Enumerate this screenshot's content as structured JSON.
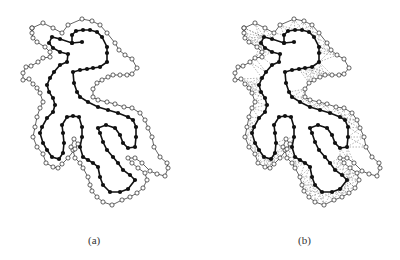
{
  "panels": [
    {
      "id": "a",
      "caption": "(a)",
      "offset_x": 0,
      "offset_y": 0,
      "spokes": false
    },
    {
      "id": "b",
      "caption": "(b)",
      "offset_x": 212,
      "offset_y": 0,
      "spokes": true
    }
  ],
  "style": {
    "inner_color": "#111111",
    "outer_color": "#222222",
    "spoke_color": "#666666",
    "background": "#ffffff"
  },
  "inner_chain": [
    [
      82,
      42
    ],
    [
      72,
      43
    ],
    [
      60,
      39
    ],
    [
      52,
      37
    ],
    [
      49,
      43
    ],
    [
      53,
      48
    ],
    [
      60,
      52
    ],
    [
      68,
      54
    ],
    [
      67,
      62
    ],
    [
      60,
      65
    ],
    [
      54,
      72
    ],
    [
      50,
      78
    ],
    [
      47,
      85
    ],
    [
      49,
      92
    ],
    [
      53,
      98
    ],
    [
      55,
      105
    ],
    [
      53,
      112
    ],
    [
      47,
      118
    ],
    [
      42,
      127
    ],
    [
      40,
      133
    ],
    [
      43,
      143
    ],
    [
      47,
      150
    ],
    [
      52,
      157
    ],
    [
      59,
      159
    ],
    [
      63,
      153
    ],
    [
      64,
      143
    ],
    [
      63,
      133
    ],
    [
      62,
      125
    ],
    [
      67,
      117
    ],
    [
      73,
      116
    ],
    [
      79,
      117
    ],
    [
      82,
      127
    ],
    [
      82,
      137
    ],
    [
      80,
      147
    ],
    [
      83,
      157
    ],
    [
      88,
      160
    ],
    [
      93,
      163
    ],
    [
      98,
      167
    ],
    [
      100,
      177
    ],
    [
      103,
      185
    ],
    [
      110,
      192
    ],
    [
      120,
      192
    ],
    [
      128,
      189
    ],
    [
      135,
      180
    ],
    [
      130,
      175
    ],
    [
      123,
      170
    ],
    [
      118,
      163
    ],
    [
      113,
      157
    ],
    [
      107,
      150
    ],
    [
      103,
      142
    ],
    [
      100,
      133
    ],
    [
      98,
      128
    ],
    [
      106,
      125
    ],
    [
      115,
      128
    ],
    [
      120,
      135
    ],
    [
      123,
      143
    ],
    [
      128,
      148
    ],
    [
      135,
      147
    ],
    [
      136,
      137
    ],
    [
      136,
      127
    ],
    [
      133,
      120
    ],
    [
      128,
      117
    ],
    [
      118,
      113
    ],
    [
      108,
      110
    ],
    [
      98,
      107
    ],
    [
      88,
      102
    ],
    [
      80,
      97
    ],
    [
      77,
      92
    ],
    [
      74,
      83
    ],
    [
      73,
      72
    ],
    [
      80,
      70
    ],
    [
      87,
      69
    ],
    [
      93,
      68
    ],
    [
      100,
      67
    ],
    [
      107,
      62
    ],
    [
      107,
      53
    ],
    [
      107,
      47
    ],
    [
      102,
      37
    ],
    [
      97,
      32
    ],
    [
      90,
      30
    ],
    [
      83,
      30
    ],
    [
      76,
      31
    ],
    [
      72,
      35
    ],
    [
      72,
      43
    ]
  ],
  "outer_chain": [
    [
      32,
      28
    ],
    [
      43,
      23
    ],
    [
      53,
      28
    ],
    [
      62,
      33
    ],
    [
      68,
      25
    ],
    [
      82,
      19
    ],
    [
      92,
      21
    ],
    [
      100,
      25
    ],
    [
      107,
      33
    ],
    [
      115,
      43
    ],
    [
      119,
      50
    ],
    [
      125,
      55
    ],
    [
      132,
      59
    ],
    [
      137,
      68
    ],
    [
      132,
      74
    ],
    [
      127,
      75
    ],
    [
      120,
      75
    ],
    [
      113,
      75
    ],
    [
      108,
      77
    ],
    [
      102,
      80
    ],
    [
      97,
      83
    ],
    [
      93,
      89
    ],
    [
      93,
      97
    ],
    [
      98,
      100
    ],
    [
      107,
      102
    ],
    [
      115,
      104
    ],
    [
      124,
      107
    ],
    [
      132,
      108
    ],
    [
      140,
      113
    ],
    [
      145,
      120
    ],
    [
      148,
      128
    ],
    [
      152,
      137
    ],
    [
      154,
      147
    ],
    [
      160,
      157
    ],
    [
      167,
      163
    ],
    [
      168,
      168
    ],
    [
      165,
      176
    ],
    [
      157,
      174
    ],
    [
      150,
      171
    ],
    [
      142,
      163
    ],
    [
      135,
      158
    ],
    [
      128,
      158
    ],
    [
      132,
      163
    ],
    [
      138,
      168
    ],
    [
      145,
      173
    ],
    [
      147,
      180
    ],
    [
      143,
      188
    ],
    [
      137,
      193
    ],
    [
      130,
      197
    ],
    [
      122,
      200
    ],
    [
      112,
      205
    ],
    [
      103,
      202
    ],
    [
      97,
      197
    ],
    [
      92,
      191
    ],
    [
      90,
      185
    ],
    [
      88,
      177
    ],
    [
      83,
      168
    ],
    [
      80,
      163
    ],
    [
      75,
      158
    ],
    [
      73,
      150
    ],
    [
      71,
      147
    ],
    [
      74,
      139
    ],
    [
      78,
      144
    ],
    [
      75,
      149
    ],
    [
      68,
      158
    ],
    [
      62,
      164
    ],
    [
      58,
      168
    ],
    [
      53,
      167
    ],
    [
      46,
      163
    ],
    [
      43,
      154
    ],
    [
      37,
      147
    ],
    [
      33,
      137
    ],
    [
      35,
      127
    ],
    [
      37,
      117
    ],
    [
      40,
      108
    ],
    [
      43,
      102
    ],
    [
      40,
      93
    ],
    [
      37,
      88
    ],
    [
      33,
      84
    ],
    [
      29,
      79
    ],
    [
      23,
      80
    ],
    [
      23,
      73
    ],
    [
      26,
      67
    ],
    [
      31,
      66
    ],
    [
      38,
      62
    ],
    [
      43,
      58
    ],
    [
      50,
      57
    ],
    [
      50,
      52
    ],
    [
      45,
      47
    ],
    [
      37,
      42
    ],
    [
      33,
      38
    ],
    [
      32,
      33
    ],
    [
      32,
      28
    ]
  ]
}
